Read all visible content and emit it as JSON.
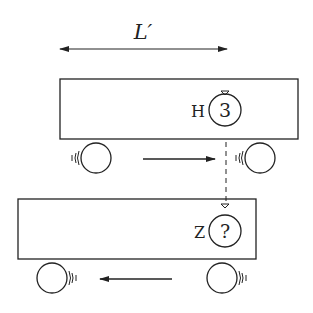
{
  "diagram": {
    "length_label": "L′",
    "upper_car": {
      "clock_label": "H",
      "clock_value": "3",
      "motion": "right"
    },
    "lower_car": {
      "clock_label": "Z",
      "clock_value": "?",
      "motion": "left"
    },
    "colors": {
      "stroke": "#222222",
      "background": "#ffffff"
    }
  }
}
